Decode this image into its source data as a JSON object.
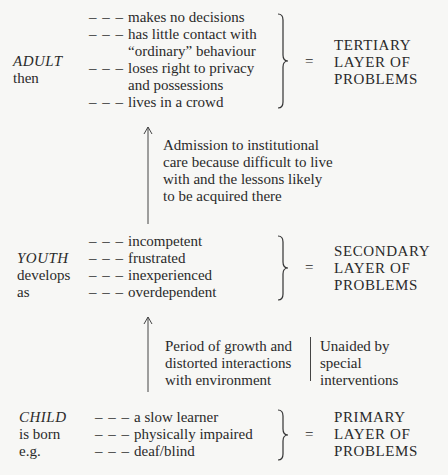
{
  "adult": {
    "label": "ADULT",
    "sublabel": [
      "then"
    ],
    "items": [
      [
        "makes no decisions"
      ],
      [
        "has little contact with",
        "“ordinary” behaviour"
      ],
      [
        "loses right to privacy",
        "and possessions"
      ],
      [
        "lives in a crowd"
      ]
    ],
    "equals": "=",
    "result": [
      "TERTIARY",
      "LAYER OF",
      "PROBLEMS"
    ]
  },
  "transition_1": {
    "text": [
      "Admission to institutional",
      "care because difficult to live",
      "with and the lessons likely",
      "to be acquired there"
    ]
  },
  "youth": {
    "label": "YOUTH",
    "sublabel": [
      "develops",
      "as"
    ],
    "items": [
      [
        "incompetent"
      ],
      [
        "frustrated"
      ],
      [
        "inexperienced"
      ],
      [
        "overdependent"
      ]
    ],
    "equals": "=",
    "result": [
      "SECONDARY",
      "LAYER OF",
      "PROBLEMS"
    ]
  },
  "transition_2": {
    "text": [
      "Period of growth and",
      "distorted interactions",
      "with environment"
    ],
    "side_note": [
      "Unaided by",
      "special",
      "interventions"
    ]
  },
  "child": {
    "label": "CHILD",
    "sublabel": [
      "is born",
      "e.g."
    ],
    "items": [
      [
        "a slow learner"
      ],
      [
        "physically impaired"
      ],
      [
        "deaf/blind"
      ]
    ],
    "equals": "=",
    "result": [
      "PRIMARY",
      "LAYER OF",
      "PROBLEMS"
    ]
  },
  "dash": "– – –"
}
